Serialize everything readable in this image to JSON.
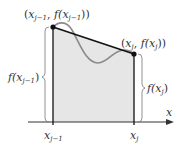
{
  "diagram": {
    "colors": {
      "fill": "#e6e6e6",
      "curve": "#8a8a8a",
      "line": "#111111",
      "brace": "#777777",
      "text": "#333333"
    },
    "labels": {
      "left_point": {
        "open": "(",
        "x": "x",
        "xsub": "j−1",
        "sep": ", ",
        "f": "f(x",
        "fsub": "j−1",
        "close": "))"
      },
      "right_point": {
        "open": "(",
        "x": "x",
        "xsub": "j",
        "sep": ", ",
        "f": "f(x",
        "fsub": "j",
        "close": "))"
      },
      "left_height": {
        "f": "f(x",
        "sub": "j−1",
        "close": ")"
      },
      "right_height": {
        "f": "f(x",
        "sub": "j",
        "close": ")"
      },
      "axis": "x",
      "tick_left": {
        "base": "x",
        "sub": "j−1"
      },
      "tick_right": {
        "base": "x",
        "sub": "j"
      }
    }
  }
}
